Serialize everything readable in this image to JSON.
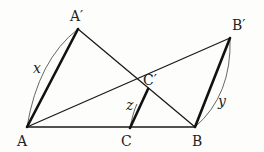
{
  "diagram": {
    "type": "geometry",
    "points": {
      "A": {
        "label": "A",
        "x": 27,
        "y": 127
      },
      "Ap": {
        "label": "A′",
        "x": 78,
        "y": 29
      },
      "C": {
        "label": "C",
        "x": 130,
        "y": 128
      },
      "Cp": {
        "label": "C′",
        "x": 148,
        "y": 89
      },
      "B": {
        "label": "B",
        "x": 195,
        "y": 127
      },
      "Bp": {
        "label": "B′",
        "x": 230,
        "y": 38
      }
    },
    "segments": [
      {
        "from": "A",
        "to": "Ap",
        "weight": "thick"
      },
      {
        "from": "Ap",
        "to": "B",
        "weight": "thin"
      },
      {
        "from": "A",
        "to": "B",
        "weight": "thin"
      },
      {
        "from": "A",
        "to": "Bp",
        "weight": "thin"
      },
      {
        "from": "B",
        "to": "Bp",
        "weight": "thick"
      },
      {
        "from": "C",
        "to": "Cp",
        "weight": "thick"
      }
    ],
    "variables": {
      "x": "x",
      "y": "y",
      "z": "z"
    },
    "labels": {
      "A": "A",
      "Ap": "A′",
      "B": "B",
      "Bp": "B′",
      "C": "C",
      "Cp": "C′"
    },
    "colors": {
      "line": "#111111",
      "arc": "#555555",
      "text": "#222222",
      "background": "#fdfdfb"
    }
  }
}
